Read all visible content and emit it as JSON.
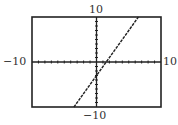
{
  "chart_data": {
    "type": "line",
    "title": "",
    "xlabel": "",
    "ylabel": "",
    "xlim": [
      -10,
      10
    ],
    "ylim": [
      -10,
      10
    ],
    "grid": false,
    "legend": null,
    "tick_labels": {
      "x_min": "−10",
      "x_max": "10",
      "y_min": "−10",
      "y_max": "10"
    },
    "tick_spacing": 1,
    "series": [
      {
        "name": "y = 2x − 3",
        "x": [
          -3.5,
          6.5
        ],
        "y": [
          -10,
          10
        ],
        "slope": 2,
        "intercept": -3
      }
    ]
  },
  "labels": {
    "y_max": "10",
    "y_min": "−10",
    "x_min": "−10",
    "x_max": "10"
  },
  "colors": {
    "frame": "#222222",
    "axis": "#222222",
    "line": "#222222"
  }
}
